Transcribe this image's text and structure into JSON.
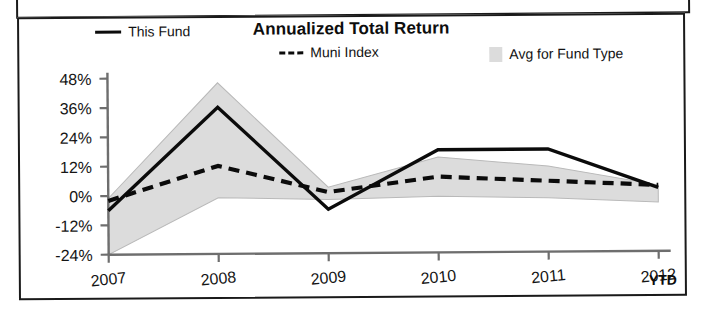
{
  "chart_data": {
    "type": "line",
    "title": "Annualized Total Return",
    "xlabel": "",
    "ylabel": "",
    "x_note": "YTD",
    "categories": [
      "2007",
      "2008",
      "2009",
      "2010",
      "2011",
      "2012"
    ],
    "ylim": [
      -24,
      48
    ],
    "yticks": [
      48,
      36,
      24,
      12,
      0,
      -12,
      -24
    ],
    "ytick_labels": [
      "48%",
      "36%",
      "24%",
      "12%",
      "0%",
      "-12%",
      "-24%"
    ],
    "grid": false,
    "legend_position": "top",
    "series": [
      {
        "name": "This Fund",
        "style": "solid",
        "color": "#0b0b0b",
        "values": [
          -6,
          36,
          -6,
          18,
          18,
          2
        ]
      },
      {
        "name": "Muni Index",
        "style": "dashed",
        "color": "#0b0b0b",
        "values": [
          -2,
          12,
          1,
          7,
          5,
          3
        ]
      },
      {
        "name": "Avg for Fund Type",
        "style": "band",
        "color": "#dcdcdc",
        "upper": [
          -1,
          46,
          3,
          15,
          11,
          3
        ],
        "lower": [
          -24,
          -1,
          -2,
          -1,
          -2,
          -4
        ]
      }
    ]
  },
  "legend": {
    "fund_label": "This Fund",
    "muni_label": "Muni Index",
    "avg_label": "Avg for Fund Type"
  },
  "axes": {
    "ytick_labels": [
      "48%",
      "36%",
      "24%",
      "12%",
      "0%",
      "-12%",
      "-24%"
    ],
    "xtick_labels": [
      "2007",
      "2008",
      "2009",
      "2010",
      "2011",
      "2012"
    ],
    "ytd": "YTD"
  },
  "colors": {
    "line": "#0b0b0b",
    "band": "#dcdcdc",
    "axis": "#6e6e6e",
    "text": "#151515",
    "border": "#1a1a1a",
    "bottom_band": "#060606"
  }
}
